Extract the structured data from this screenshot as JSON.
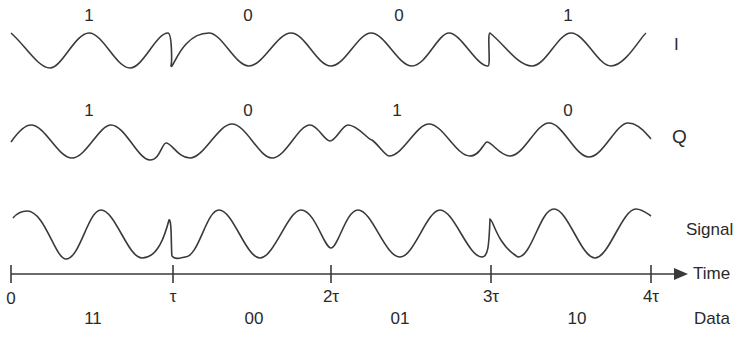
{
  "diagram": {
    "type": "QPSK modulation timing diagram",
    "rows": [
      {
        "name": "I",
        "label": "I",
        "bits": [
          "1",
          "0",
          "0",
          "1"
        ]
      },
      {
        "name": "Q",
        "label": "Q",
        "bits": [
          "1",
          "0",
          "1",
          "0"
        ]
      },
      {
        "name": "Signal",
        "label": "Signal"
      }
    ],
    "axis": {
      "label": "Time",
      "ticks": [
        "0",
        "τ",
        "2τ",
        "3τ",
        "4τ"
      ]
    },
    "data_row": {
      "label": "Data",
      "symbols": [
        "11",
        "00",
        "01",
        "10"
      ]
    },
    "colors": {
      "line": "#3a3a3a",
      "text": "#2a2a2a",
      "background": "#ffffff"
    }
  }
}
